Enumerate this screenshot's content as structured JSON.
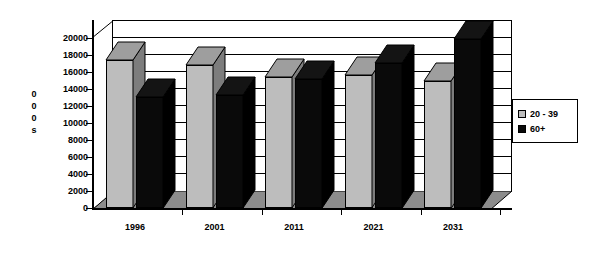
{
  "chart_data": {
    "type": "bar",
    "title": "",
    "subtitle": "",
    "xlabel": "",
    "ylabel": "000s",
    "ylim": [
      0,
      20000
    ],
    "ytick_step": 2000,
    "yticks": [
      "20000",
      "18000",
      "16000",
      "14000",
      "12000",
      "10000",
      "8000",
      "6000",
      "4000",
      "2000",
      "0"
    ],
    "categories": [
      "1996",
      "2001",
      "2011",
      "2021",
      "2031"
    ],
    "grid": true,
    "legend_position": "right",
    "style": "3d-column",
    "series": [
      {
        "name": "20 - 39",
        "color": "#bdbdbd",
        "side_color": "#7d7d7d",
        "values": [
          17400,
          16800,
          15400,
          15600,
          15000
        ]
      },
      {
        "name": "60+",
        "color": "#0a0a0a",
        "side_color": "#000000",
        "values": [
          13100,
          13300,
          15200,
          17100,
          19900
        ]
      }
    ]
  },
  "y_axis_title_chars": [
    "0",
    "0",
    "0",
    "s"
  ],
  "legend": {
    "items": [
      {
        "label": "20 - 39",
        "swatch": "gray"
      },
      {
        "label": "60+",
        "swatch": "black"
      }
    ]
  },
  "colors": {
    "bar_gray": "#bdbdbd",
    "bar_gray_side": "#7d7d7d",
    "bar_black": "#0a0a0a",
    "axis": "#000000",
    "background": "#ffffff"
  }
}
